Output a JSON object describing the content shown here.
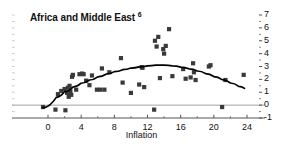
{
  "title": {
    "text": "Africa and Middle East",
    "footnote": "6"
  },
  "axis_label_color": "#111111",
  "marker_color": "#3a3a3a",
  "curve_color": "#000000",
  "zero_line_color": "#999999",
  "axis_color": "#555555",
  "chart_data": {
    "type": "scatter",
    "title": "Africa and Middle East 6",
    "xlabel": "Inflation",
    "ylabel": "",
    "xlim": [
      -1.5,
      25
    ],
    "ylim": [
      -1,
      7
    ],
    "xticks": [
      0,
      4,
      8,
      12,
      16,
      20,
      24
    ],
    "xtick_labels": [
      "0",
      "4",
      "8",
      "12",
      "16",
      "20",
      "24"
    ],
    "yticks": [
      -1,
      0,
      1,
      2,
      3,
      4,
      5,
      6,
      7
    ],
    "ytick_labels": [
      "-1",
      "0",
      "1",
      "2",
      "3",
      "4",
      "5",
      "6",
      "7"
    ],
    "yaxis_position": "right",
    "grid": false,
    "legend": null,
    "zero_line": 0,
    "points": [
      [
        -0.6,
        -0.15
      ],
      [
        0.9,
        -0.35
      ],
      [
        1.2,
        0.85
      ],
      [
        1.6,
        1.1
      ],
      [
        2.0,
        1.25
      ],
      [
        2.1,
        -0.4
      ],
      [
        2.3,
        0.95
      ],
      [
        2.4,
        1.35
      ],
      [
        2.5,
        0.65
      ],
      [
        2.6,
        1.5
      ],
      [
        2.7,
        1.05
      ],
      [
        2.8,
        0.8
      ],
      [
        2.9,
        2.2
      ],
      [
        3.0,
        2.35
      ],
      [
        3.4,
        1.2
      ],
      [
        3.8,
        2.4
      ],
      [
        4.1,
        2.45
      ],
      [
        4.3,
        2.4
      ],
      [
        4.6,
        1.9
      ],
      [
        5.0,
        1.55
      ],
      [
        5.3,
        2.3
      ],
      [
        5.9,
        1.2
      ],
      [
        6.3,
        1.2
      ],
      [
        6.5,
        2.85
      ],
      [
        6.8,
        1.2
      ],
      [
        7.4,
        2.55
      ],
      [
        8.8,
        3.65
      ],
      [
        9.0,
        1.75
      ],
      [
        10.0,
        0.95
      ],
      [
        11.0,
        1.6
      ],
      [
        11.3,
        2.95
      ],
      [
        11.4,
        2.9
      ],
      [
        11.6,
        1.4
      ],
      [
        12.8,
        -0.35
      ],
      [
        12.9,
        5.0
      ],
      [
        13.1,
        4.55
      ],
      [
        13.3,
        5.3
      ],
      [
        13.5,
        2.1
      ],
      [
        13.9,
        4.35
      ],
      [
        14.0,
        4.0
      ],
      [
        14.2,
        4.6
      ],
      [
        14.6,
        5.9
      ],
      [
        15.0,
        2.25
      ],
      [
        16.3,
        2.8
      ],
      [
        16.6,
        2.05
      ],
      [
        17.2,
        2.15
      ],
      [
        17.5,
        3.25
      ],
      [
        17.6,
        2.55
      ],
      [
        17.8,
        1.95
      ],
      [
        19.4,
        3.0
      ],
      [
        19.6,
        3.1
      ],
      [
        21.0,
        -0.15
      ],
      [
        21.4,
        1.95
      ],
      [
        23.6,
        2.35
      ]
    ],
    "fit_curve": {
      "kind": "quadratic",
      "description": "concave quadratic fit peaking near inflation 14",
      "path_points": [
        [
          -0.6,
          -0.2
        ],
        [
          1.0,
          0.6
        ],
        [
          2.0,
          1.05
        ],
        [
          3.0,
          1.4
        ],
        [
          4.0,
          1.7
        ],
        [
          5.0,
          1.95
        ],
        [
          6.0,
          2.2
        ],
        [
          7.0,
          2.4
        ],
        [
          8.0,
          2.6
        ],
        [
          9.0,
          2.75
        ],
        [
          10.0,
          2.88
        ],
        [
          11.0,
          2.97
        ],
        [
          12.0,
          3.05
        ],
        [
          13.0,
          3.1
        ],
        [
          14.0,
          3.1
        ],
        [
          15.0,
          3.05
        ],
        [
          16.0,
          2.95
        ],
        [
          17.0,
          2.82
        ],
        [
          18.0,
          2.65
        ],
        [
          19.0,
          2.45
        ],
        [
          20.0,
          2.22
        ],
        [
          21.0,
          1.98
        ],
        [
          22.0,
          1.72
        ],
        [
          23.0,
          1.45
        ],
        [
          23.7,
          1.3
        ]
      ]
    }
  }
}
